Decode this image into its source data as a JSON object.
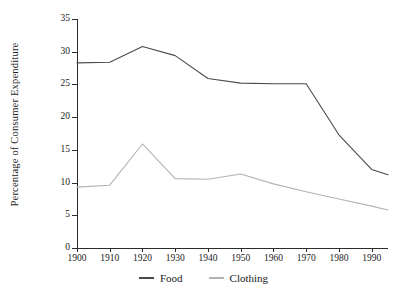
{
  "chart_data": {
    "type": "line",
    "title": "",
    "xlabel": "",
    "ylabel": "Percentage of Consumer Expenditure",
    "xlim": [
      1900,
      1995
    ],
    "ylim": [
      0,
      35
    ],
    "grid": false,
    "legend_position": "bottom",
    "xticks": [
      1900,
      1910,
      1920,
      1930,
      1940,
      1950,
      1960,
      1970,
      1980,
      1990
    ],
    "xtick_labels": [
      "1900",
      "1910",
      "1920",
      "1930",
      "1940",
      "1950",
      "1960",
      "1970",
      "1980",
      "1990"
    ],
    "yticks": [
      0,
      5,
      10,
      15,
      20,
      25,
      30,
      35
    ],
    "ytick_labels": [
      "0",
      "5",
      "10",
      "15",
      "20",
      "25",
      "30",
      "35"
    ],
    "x": [
      1900,
      1910,
      1920,
      1930,
      1940,
      1950,
      1960,
      1970,
      1980,
      1990,
      1995
    ],
    "series": [
      {
        "name": "Food",
        "color": "#4a4a4a",
        "values": [
          28.3,
          28.4,
          30.8,
          29.4,
          25.9,
          25.2,
          25.1,
          25.1,
          17.3,
          12.0,
          11.2
        ]
      },
      {
        "name": "Clothing",
        "color": "#b3b3b3",
        "values": [
          9.3,
          9.6,
          15.9,
          10.6,
          10.5,
          11.3,
          9.8,
          8.6,
          7.5,
          6.4,
          5.8
        ]
      }
    ]
  },
  "legend": {
    "items": [
      {
        "label": "Food",
        "color": "#4a4a4a"
      },
      {
        "label": "Clothing",
        "color": "#b3b3b3"
      }
    ]
  },
  "axes": {
    "y_title": "Percentage of Consumer Expenditure"
  }
}
